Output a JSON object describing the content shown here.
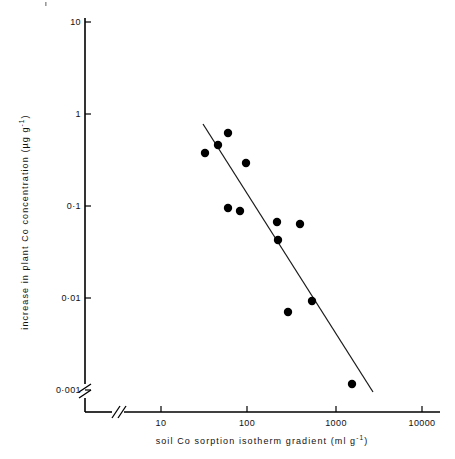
{
  "chart_data": {
    "type": "scatter",
    "title": "",
    "xlabel": "soil Co sorption isotherm gradient (ml g-1)",
    "xlabel_main": "soil Co sorption isotherm gradient (ml g",
    "xlabel_sup": "-1",
    "xlabel_tail": ")",
    "ylabel_main": "increase in plant  Co concentration (µg g",
    "ylabel_sup": "-1",
    "ylabel_tail": ")",
    "ylabel": "increase in plant Co concentration (ug g-1)",
    "xscale": "log",
    "yscale": "log",
    "xlim": [
      5,
      10000
    ],
    "ylim": [
      0.001,
      10
    ],
    "grid": false,
    "legend": null,
    "axis_break_x": true,
    "axis_break_y": true,
    "xticks": [
      {
        "value": 10,
        "label": "10",
        "px": 161
      },
      {
        "value": 100,
        "label": "100",
        "px": 247
      },
      {
        "value": 1000,
        "label": "1000",
        "px": 336
      },
      {
        "value": 10000,
        "label": "10000",
        "px": 422
      }
    ],
    "yticks": [
      {
        "value": 10,
        "label": "10",
        "px": 22
      },
      {
        "value": 1,
        "label": "1",
        "px": 114
      },
      {
        "value": 0.1,
        "label": "0·1",
        "px": 206
      },
      {
        "value": 0.01,
        "label": "0·01",
        "px": 298
      },
      {
        "value": 0.001,
        "label": "0·001",
        "px": 390
      }
    ],
    "points": [
      {
        "x": 40,
        "y": 0.33,
        "px": 205,
        "py": 153
      },
      {
        "x": 52,
        "y": 0.43,
        "px": 218,
        "py": 145
      },
      {
        "x": 68,
        "y": 0.6,
        "px": 228,
        "py": 133
      },
      {
        "x": 100,
        "y": 0.26,
        "px": 246,
        "py": 163
      },
      {
        "x": 68,
        "y": 0.095,
        "px": 228,
        "py": 208
      },
      {
        "x": 88,
        "y": 0.086,
        "px": 240,
        "py": 211
      },
      {
        "x": 205,
        "y": 0.062,
        "px": 277,
        "py": 222
      },
      {
        "x": 370,
        "y": 0.057,
        "px": 300,
        "py": 224
      },
      {
        "x": 210,
        "y": 0.039,
        "px": 278,
        "py": 240
      },
      {
        "x": 290,
        "y": 0.0061,
        "px": 288,
        "py": 312
      },
      {
        "x": 540,
        "y": 0.0086,
        "px": 312,
        "py": 301
      },
      {
        "x": 1400,
        "y": 0.00105,
        "px": 352,
        "py": 384
      }
    ],
    "fit_line": {
      "description": "least-squares regression line",
      "x_start": 38,
      "y_start": 0.8,
      "x_end": 2200,
      "y_end": 0.00095,
      "px_start": 203,
      "py_start": 124,
      "px_end": 373,
      "py_end": 392
    }
  },
  "figure": {
    "background": "#ffffff",
    "ink": "#000000",
    "marker": "filled-circle",
    "marker_radius": 4.2
  }
}
